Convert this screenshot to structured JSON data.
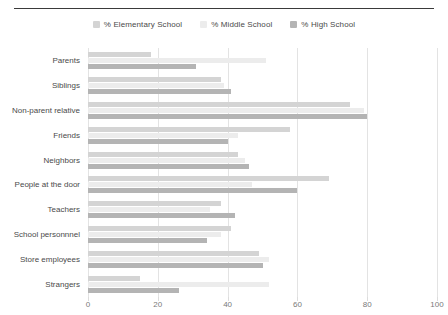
{
  "page": {
    "cropped_heading": "",
    "background": "#ffffff"
  },
  "chart_data": {
    "type": "bar",
    "orientation": "horizontal",
    "title": "",
    "subtitle": "",
    "xlabel": "",
    "ylabel": "",
    "xlim": [
      0,
      100
    ],
    "xticks": [
      0,
      20,
      40,
      60,
      80,
      100
    ],
    "grid": "vertical",
    "legend_position": "top-center",
    "categories": [
      "Parents",
      "Siblings",
      "Non-parent relative",
      "Friends",
      "Neighbors",
      "People at the door",
      "Teachers",
      "School personnnel",
      "Store employees",
      "Strangers"
    ],
    "series": [
      {
        "name": "% Elementary School",
        "color": "#d4d4d4",
        "values": [
          18,
          38,
          75,
          58,
          43,
          69,
          38,
          41,
          49,
          15
        ]
      },
      {
        "name": "% Middle School",
        "color": "#ececec",
        "values": [
          51,
          39,
          79,
          43,
          45,
          47,
          35,
          38,
          52,
          52
        ]
      },
      {
        "name": "% High School",
        "color": "#b4b4b4",
        "values": [
          31,
          41,
          80,
          40,
          46,
          60,
          42,
          34,
          50,
          26
        ]
      }
    ]
  },
  "legend": {
    "items": [
      {
        "label": "% Elementary School",
        "color": "#d4d4d4"
      },
      {
        "label": "% Middle School",
        "color": "#ececec"
      },
      {
        "label": "% High School",
        "color": "#b4b4b4"
      }
    ]
  }
}
